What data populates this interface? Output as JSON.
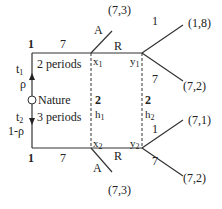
{
  "diagram": {
    "type": "game-tree",
    "nature": {
      "label": "Nature",
      "up_prob": "ρ",
      "down_prob": "1-ρ",
      "up_type": "t1",
      "down_type": "t2"
    },
    "top_branch": {
      "player": "1",
      "type_label": "2 periods",
      "move_label": "7",
      "node_x": "x1",
      "node_y": "y1",
      "info_player": "2",
      "info_set": "h1",
      "accept": "A",
      "reject": "R",
      "accept_payoff": "(7,3)",
      "y_branch_up": "1",
      "y_branch_down": "7",
      "payoff_up": "(1,8)",
      "payoff_down": "(7,2)"
    },
    "bottom_branch": {
      "player": "1",
      "type_label": "3 periods",
      "move_label": "7",
      "node_x": "x2",
      "node_y": "y2",
      "info_player": "2",
      "info_set": "h2",
      "accept": "A",
      "reject": "R",
      "accept_payoff": "(7,3)",
      "y_branch_up": "1",
      "y_branch_down": "7",
      "payoff_up": "(7,1)",
      "payoff_down": "(7,2)"
    }
  }
}
